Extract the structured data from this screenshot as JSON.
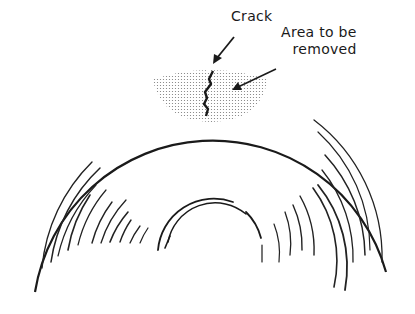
{
  "diagram": {
    "labels": {
      "crack": "Crack",
      "area_line1": "Area to be",
      "area_line2": "removed"
    },
    "colors": {
      "ink": "#1a1a1a",
      "background": "#ffffff",
      "stipple": "#7a7a7a"
    }
  }
}
